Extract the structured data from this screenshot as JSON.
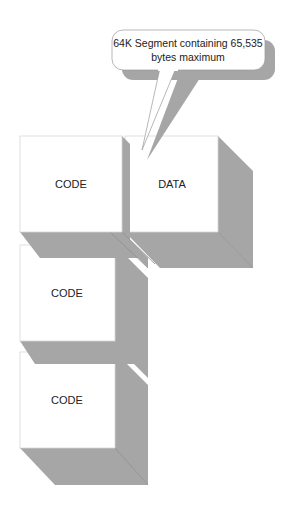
{
  "diagram": {
    "callout": {
      "line1": "64K Segment containing 65,535",
      "line2": "bytes maximum"
    },
    "blocks": [
      {
        "id": "code-1",
        "label": "CODE"
      },
      {
        "id": "data",
        "label": "DATA"
      },
      {
        "id": "code-2",
        "label": "CODE"
      },
      {
        "id": "code-3",
        "label": "CODE"
      }
    ],
    "colors": {
      "face": "#ffffff",
      "shadow": "#a6a6a6",
      "edge": "#bdbdbd",
      "text": "#222222"
    }
  }
}
